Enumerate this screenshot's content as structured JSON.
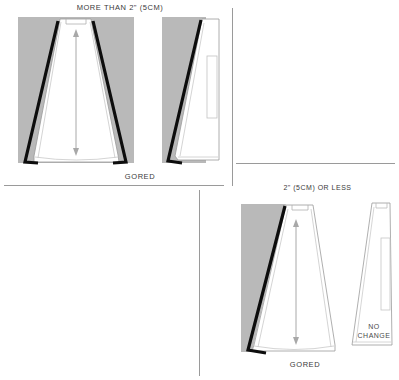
{
  "page": {
    "width": 399,
    "height": 380,
    "background": "#ffffff"
  },
  "colors": {
    "gray_block": "#b9b9b9",
    "gray_block_light": "#c2c2c2",
    "bold_line": "#0d0d0d",
    "thin_outline": "#9a9a9a",
    "divider": "#9a9a9a",
    "text": "#3a3a3a",
    "pattern_fill": "#ffffff",
    "arrow": "#a8a8a8"
  },
  "sections": {
    "top_left": {
      "heading": "MORE THAN 2\" (5CM)",
      "footer_label": "GORED",
      "figures": [
        {
          "name": "gored-skirt-front-wide",
          "description": "A-line gored skirt panel with gray background block, bold black trim lines on both sides, center grainline double arrow"
        },
        {
          "name": "gored-skirt-side-narrow",
          "description": "Narrow gored panel with gray block on left, bold black diagonal trim line, thin inner rectangle detail"
        }
      ]
    },
    "bottom_right": {
      "heading": "2\" (5CM) OR LESS",
      "footer_label": "GORED",
      "no_change_label_line1": "NO",
      "no_change_label_line2": "CHANGE",
      "figures": [
        {
          "name": "gored-skirt-front-reduced",
          "description": "A-line gored skirt panel with gray block only on left, bold black diagonal trim line, center grainline double arrow"
        },
        {
          "name": "gored-skirt-side-unchanged",
          "description": "Narrow tapered panel, white, thin inner rectangle detail, labelled NO CHANGE"
        }
      ]
    }
  },
  "dividers": [
    {
      "name": "divider-top-left-bottom",
      "orientation": "h"
    },
    {
      "name": "divider-top-vertical",
      "orientation": "v"
    },
    {
      "name": "divider-right-horizontal",
      "orientation": "h"
    },
    {
      "name": "divider-bottom-vertical",
      "orientation": "v"
    }
  ]
}
